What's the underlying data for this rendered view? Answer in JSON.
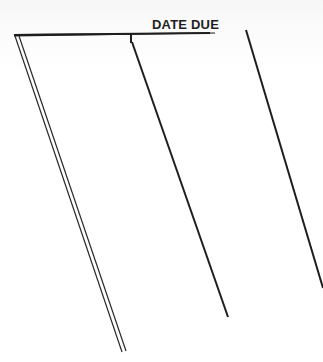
{
  "card": {
    "title": "DATE DUE",
    "ink_color": "#1e1e1e",
    "paper_color": "#ffffff",
    "columns": 3,
    "rows": []
  }
}
